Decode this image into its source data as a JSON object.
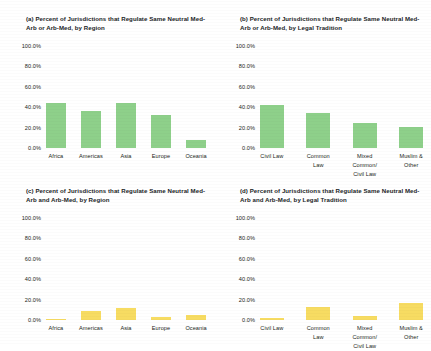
{
  "figure": {
    "background_color": "#ffffff",
    "green": "#8ed08a",
    "yellow": "#f7dc62"
  },
  "yticks": [
    "100.0%",
    "80.0%",
    "60.0%",
    "40.0%",
    "20.0%",
    "0.0%"
  ],
  "chart_data": [
    {
      "type": "bar",
      "panel": "a",
      "title": "(a) Percent of Jurisdictions that Regulate Same Neutral Med-Arb or Arb-Med, by Region",
      "categories": [
        "Africa",
        "Americas",
        "Asia",
        "Europe",
        "Oceania"
      ],
      "values": [
        44,
        36,
        44,
        32,
        8
      ],
      "xlabel": "",
      "ylabel": "",
      "ylim": [
        0,
        100
      ],
      "ytick_values": [
        0,
        20,
        40,
        60,
        80,
        100
      ],
      "ytick_labels": [
        "0.0%",
        "20.0%",
        "40.0%",
        "60.0%",
        "80.0%",
        "100.0%"
      ],
      "color": "#8ed08a",
      "grid": false,
      "legend": "none"
    },
    {
      "type": "bar",
      "panel": "b",
      "title": "(b) Percent of Jurisdictions that Regulate Same Neutral Med-Arb or Arb-Med, by Legal Tradition",
      "categories": [
        "Civil Law",
        "Common\nLaw",
        "Mixed\nCommon/\nCivil Law",
        "Muslim &\nOther"
      ],
      "values": [
        42,
        34,
        25,
        21
      ],
      "xlabel": "",
      "ylabel": "",
      "ylim": [
        0,
        100
      ],
      "ytick_values": [
        0,
        20,
        40,
        60,
        80,
        100
      ],
      "ytick_labels": [
        "0.0%",
        "20.0%",
        "40.0%",
        "60.0%",
        "80.0%",
        "100.0%"
      ],
      "color": "#8ed08a",
      "grid": false,
      "legend": "none"
    },
    {
      "type": "bar",
      "panel": "c",
      "title": "(c) Percent of Jurisdictions that Regulate Same Neutral Med-Arb and Arb-Med, by Region",
      "categories": [
        "Africa",
        "Americas",
        "Asia",
        "Europe",
        "Oceania"
      ],
      "values": [
        1,
        9,
        12,
        3,
        5
      ],
      "xlabel": "",
      "ylabel": "",
      "ylim": [
        0,
        100
      ],
      "ytick_values": [
        0,
        20,
        40,
        60,
        80,
        100
      ],
      "ytick_labels": [
        "0.0%",
        "20.0%",
        "40.0%",
        "60.0%",
        "80.0%",
        "100.0%"
      ],
      "color": "#f7dc62",
      "grid": false,
      "legend": "none"
    },
    {
      "type": "bar",
      "panel": "d",
      "title": "(d) Percent of Jurisdictions that Regulate Same Neutral Med-Arb and Arb-Med, by Legal Tradition",
      "categories": [
        "Civil Law",
        "Common\nLaw",
        "Mixed\nCommon/\nCivil Law",
        "Muslim &\nOther"
      ],
      "values": [
        2,
        13,
        4,
        17
      ],
      "xlabel": "",
      "ylabel": "",
      "ylim": [
        0,
        100
      ],
      "ytick_values": [
        0,
        20,
        40,
        60,
        80,
        100
      ],
      "ytick_labels": [
        "0.0%",
        "20.0%",
        "40.0%",
        "60.0%",
        "80.0%",
        "100.0%"
      ],
      "color": "#f7dc62",
      "grid": false,
      "legend": "none"
    }
  ]
}
